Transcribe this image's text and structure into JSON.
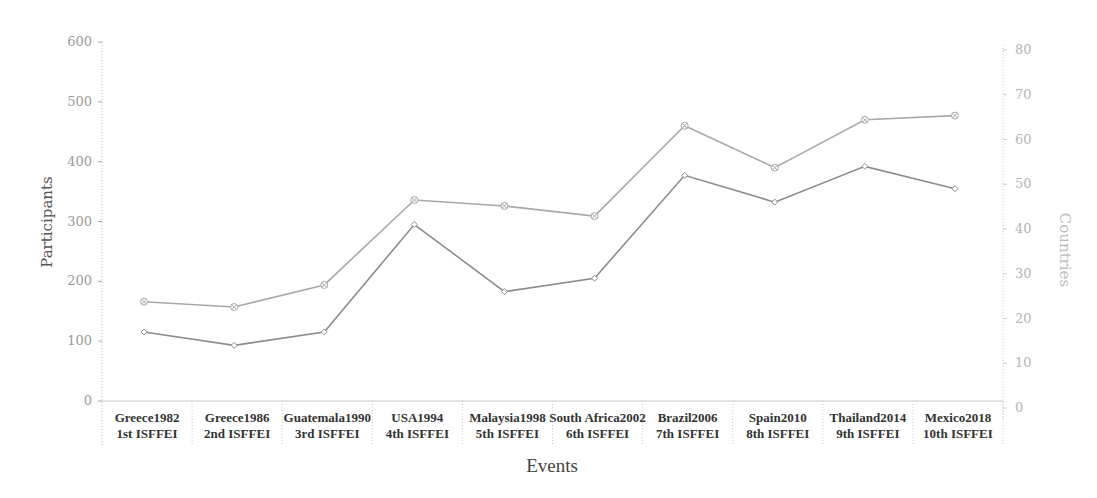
{
  "chart_data": {
    "type": "line",
    "title": "",
    "xlabel": "Events",
    "ylabel": "Participants",
    "y2label": "Countries",
    "ylim": [
      0,
      600
    ],
    "y2lim": [
      0,
      80
    ],
    "yticks": [
      0,
      100,
      200,
      300,
      400,
      500,
      600
    ],
    "y2ticks": [
      0,
      10,
      20,
      30,
      40,
      50,
      60,
      70,
      80
    ],
    "grid": false,
    "legend": null,
    "categories": [
      {
        "line1": "Greece1982",
        "line2": "1st ISFFEI"
      },
      {
        "line1": "Greece1986",
        "line2": "2nd ISFFEI"
      },
      {
        "line1": "Guatemala1990",
        "line2": "3rd ISFFEI"
      },
      {
        "line1": "USA1994",
        "line2": "4th ISFFEI"
      },
      {
        "line1": "Malaysia1998",
        "line2": "5th ISFFEI"
      },
      {
        "line1": "South Africa2002",
        "line2": "6th ISFFEI"
      },
      {
        "line1": "Brazil2006",
        "line2": "7th ISFFEI"
      },
      {
        "line1": "Spain2010",
        "line2": "8th ISFFEI"
      },
      {
        "line1": "Thailand2014",
        "line2": "9th ISFFEI"
      },
      {
        "line1": "Mexico2018",
        "line2": "10th ISFFEI"
      }
    ],
    "series": [
      {
        "name": "Participants",
        "axis": "left",
        "marker": "circle-x",
        "color": "#a8a8a8",
        "values": [
          166,
          157,
          194,
          336,
          326,
          309,
          460,
          390,
          470,
          477
        ]
      },
      {
        "name": "Countries",
        "axis": "right",
        "marker": "diamond",
        "color": "#8c8c8c",
        "values": [
          17,
          14,
          17,
          41,
          26,
          29,
          52,
          46,
          54,
          49
        ]
      }
    ]
  }
}
